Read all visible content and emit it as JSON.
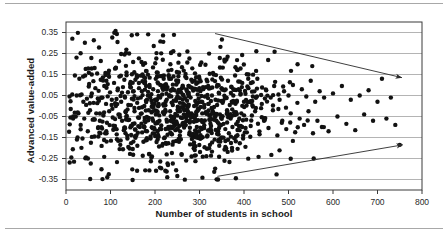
{
  "figure": {
    "kind": "scatter-plot",
    "width": 448,
    "height": 240,
    "background": "#ffffff",
    "frame_color": "#3a3a3a",
    "grid_color": "#b4b4b4",
    "point_color": "#111111",
    "arrow_color": "#2a2a2a",
    "rule_color": "#a8a8a8"
  },
  "chart_data": {
    "type": "scatter",
    "title": "",
    "subtitle": "",
    "xlabel": "Number of students in school",
    "ylabel": "Advanced value-added",
    "xlim": [
      0,
      800
    ],
    "ylim": [
      -0.4,
      0.4
    ],
    "xticks": [
      0,
      100,
      200,
      300,
      400,
      500,
      600,
      700,
      800
    ],
    "xtick_labels": [
      "0",
      "100",
      "200",
      "300",
      "400",
      "500",
      "600",
      "700",
      "800"
    ],
    "yticks": [
      0.35,
      0.25,
      0.15,
      0.05,
      -0.05,
      -0.15,
      -0.25,
      -0.35
    ],
    "ytick_labels": [
      "0.35",
      "0.25",
      "0.15",
      "0.05",
      "-0.05",
      "-0.15",
      "-0.25",
      "-0.35"
    ],
    "grid": "horizontal",
    "legend": "none",
    "marker": {
      "shape": "circle",
      "size_px": 4.4,
      "color": "#111111"
    },
    "n_points": 1000,
    "annotations": [
      {
        "name": "upper-trend-arrow",
        "kind": "arrow",
        "description": "descending arrow over upper scatter envelope",
        "x_start": 335,
        "y_start": 0.345,
        "x_end": 755,
        "y_end": 0.135
      },
      {
        "name": "lower-trend-arrow",
        "kind": "arrow",
        "description": "ascending arrow under lower scatter envelope",
        "x_start": 340,
        "y_start": -0.335,
        "x_end": 757,
        "y_end": -0.185
      }
    ],
    "series": [
      {
        "name": "schools",
        "points": [
          [
            8,
            0.045
          ],
          [
            10,
            -0.055
          ],
          [
            12,
            -0.245
          ],
          [
            14,
            0.055
          ],
          [
            16,
            -0.06
          ],
          [
            18,
            -0.265
          ],
          [
            20,
            0.145
          ],
          [
            22,
            -0.05
          ],
          [
            24,
            0.05
          ],
          [
            26,
            -0.15
          ],
          [
            28,
            -0.035
          ],
          [
            30,
            0.13
          ],
          [
            33,
            -0.09
          ],
          [
            35,
            0.055
          ],
          [
            37,
            -0.155
          ],
          [
            39,
            0.02
          ],
          [
            41,
            -0.06
          ],
          [
            43,
            0.145
          ],
          [
            45,
            -0.245
          ],
          [
            47,
            0.035
          ],
          [
            49,
            -0.12
          ],
          [
            52,
            0.105
          ],
          [
            54,
            -0.02
          ],
          [
            56,
            -0.175
          ],
          [
            58,
            0.06
          ],
          [
            60,
            -0.065
          ],
          [
            62,
            0.015
          ],
          [
            64,
            -0.145
          ],
          [
            66,
            0.085
          ],
          [
            68,
            -0.035
          ],
          [
            70,
            0.155
          ],
          [
            72,
            -0.105
          ],
          [
            74,
            0.025
          ],
          [
            76,
            -0.07
          ],
          [
            78,
            0.125
          ],
          [
            80,
            -0.19
          ],
          [
            82,
            0.04
          ],
          [
            84,
            -0.045
          ],
          [
            86,
            0.095
          ],
          [
            88,
            -0.13
          ],
          [
            90,
            0.01
          ],
          [
            92,
            -0.08
          ],
          [
            95,
            0.155
          ],
          [
            97,
            -0.025
          ],
          [
            99,
            0.065
          ],
          [
            101,
            -0.165
          ],
          [
            103,
            0.03
          ],
          [
            105,
            -0.055
          ],
          [
            108,
            0.11
          ],
          [
            110,
            -0.095
          ],
          [
            112,
            0.0
          ],
          [
            114,
            -0.135
          ],
          [
            116,
            0.075
          ],
          [
            118,
            -0.04
          ],
          [
            120,
            0.14
          ],
          [
            122,
            -0.185
          ],
          [
            124,
            0.02
          ],
          [
            126,
            -0.07
          ],
          [
            128,
            0.09
          ],
          [
            130,
            -0.115
          ],
          [
            132,
            0.045
          ],
          [
            134,
            -0.03
          ],
          [
            136,
            0.16
          ],
          [
            138,
            -0.155
          ],
          [
            140,
            0.005
          ],
          [
            142,
            -0.065
          ],
          [
            144,
            0.105
          ],
          [
            146,
            -0.095
          ],
          [
            148,
            0.035
          ],
          [
            150,
            -0.205
          ],
          [
            152,
            0.07
          ],
          [
            154,
            -0.025
          ],
          [
            156,
            0.125
          ],
          [
            158,
            -0.14
          ],
          [
            160,
            0.015
          ],
          [
            162,
            -0.055
          ],
          [
            164,
            0.085
          ],
          [
            166,
            -0.1
          ],
          [
            168,
            0.04
          ],
          [
            170,
            -0.035
          ],
          [
            172,
            0.15
          ],
          [
            174,
            -0.17
          ],
          [
            176,
            0.0
          ],
          [
            178,
            -0.075
          ],
          [
            180,
            0.095
          ],
          [
            182,
            -0.12
          ],
          [
            184,
            0.05
          ],
          [
            186,
            -0.02
          ],
          [
            188,
            0.135
          ],
          [
            190,
            -0.145
          ],
          [
            192,
            0.025
          ],
          [
            194,
            -0.06
          ],
          [
            196,
            0.08
          ],
          [
            198,
            -0.105
          ],
          [
            200,
            0.03
          ],
          [
            202,
            -0.04
          ],
          [
            204,
            0.16
          ],
          [
            206,
            -0.16
          ],
          [
            208,
            0.01
          ],
          [
            210,
            -0.07
          ],
          [
            212,
            0.1
          ],
          [
            214,
            -0.11
          ],
          [
            216,
            0.055
          ],
          [
            218,
            -0.03
          ],
          [
            220,
            0.145
          ],
          [
            222,
            -0.15
          ],
          [
            224,
            0.02
          ],
          [
            226,
            -0.065
          ],
          [
            228,
            0.09
          ],
          [
            230,
            -0.1
          ],
          [
            232,
            0.045
          ],
          [
            234,
            -0.025
          ],
          [
            236,
            0.13
          ],
          [
            238,
            -0.135
          ],
          [
            240,
            0.005
          ],
          [
            242,
            -0.08
          ],
          [
            244,
            0.075
          ],
          [
            246,
            -0.115
          ],
          [
            248,
            0.035
          ],
          [
            250,
            -0.045
          ],
          [
            252,
            0.12
          ],
          [
            254,
            -0.17
          ],
          [
            256,
            0.015
          ],
          [
            258,
            -0.055
          ],
          [
            260,
            0.085
          ],
          [
            262,
            -0.09
          ],
          [
            264,
            0.05
          ],
          [
            266,
            -0.02
          ],
          [
            268,
            0.14
          ],
          [
            270,
            -0.26
          ],
          [
            272,
            0.025
          ],
          [
            274,
            -0.07
          ],
          [
            276,
            0.095
          ],
          [
            278,
            -0.125
          ],
          [
            280,
            0.04
          ],
          [
            282,
            -0.035
          ],
          [
            284,
            0.115
          ],
          [
            286,
            -0.145
          ],
          [
            288,
            0.0
          ],
          [
            290,
            -0.06
          ],
          [
            292,
            0.08
          ],
          [
            294,
            -0.1
          ],
          [
            296,
            0.055
          ],
          [
            298,
            -0.015
          ],
          [
            300,
            0.13
          ],
          [
            302,
            -0.155
          ],
          [
            304,
            0.02
          ],
          [
            306,
            -0.075
          ],
          [
            308,
            0.09
          ],
          [
            310,
            -0.105
          ],
          [
            312,
            0.045
          ],
          [
            314,
            -0.03
          ],
          [
            316,
            0.125
          ],
          [
            318,
            -0.14
          ],
          [
            320,
            0.01
          ],
          [
            322,
            -0.065
          ],
          [
            324,
            0.085
          ],
          [
            326,
            -0.095
          ],
          [
            328,
            0.05
          ],
          [
            330,
            -0.025
          ],
          [
            332,
            0.15
          ],
          [
            334,
            -0.16
          ],
          [
            336,
            0.03
          ],
          [
            338,
            -0.07
          ],
          [
            340,
            0.1
          ],
          [
            342,
            -0.12
          ],
          [
            344,
            0.06
          ],
          [
            346,
            -0.04
          ],
          [
            348,
            0.135
          ],
          [
            350,
            -0.15
          ],
          [
            352,
            0.015
          ],
          [
            354,
            -0.085
          ],
          [
            356,
            0.075
          ],
          [
            358,
            -0.11
          ],
          [
            360,
            0.04
          ],
          [
            362,
            -0.02
          ],
          [
            364,
            0.12
          ],
          [
            366,
            -0.13
          ],
          [
            368,
            0.005
          ],
          [
            370,
            -0.06
          ],
          [
            372,
            0.09
          ],
          [
            374,
            -0.1
          ],
          [
            376,
            0.05
          ],
          [
            378,
            -0.03
          ],
          [
            380,
            0.145
          ],
          [
            382,
            -0.145
          ],
          [
            384,
            0.025
          ],
          [
            386,
            -0.075
          ],
          [
            388,
            0.08
          ],
          [
            390,
            -0.115
          ],
          [
            392,
            0.055
          ],
          [
            394,
            -0.035
          ],
          [
            396,
            0.11
          ],
          [
            398,
            -0.155
          ],
          [
            400,
            0.02
          ],
          [
            405,
            -0.065
          ],
          [
            410,
            0.085
          ],
          [
            415,
            -0.095
          ],
          [
            420,
            0.045
          ],
          [
            425,
            -0.025
          ],
          [
            430,
            0.13
          ],
          [
            435,
            -0.135
          ],
          [
            440,
            0.01
          ],
          [
            445,
            -0.07
          ],
          [
            450,
            0.075
          ],
          [
            455,
            -0.105
          ],
          [
            460,
            0.04
          ],
          [
            465,
            -0.02
          ],
          [
            470,
            0.115
          ],
          [
            475,
            -0.14
          ],
          [
            480,
            0.03
          ],
          [
            485,
            -0.08
          ],
          [
            490,
            0.07
          ],
          [
            495,
            -0.11
          ],
          [
            500,
            0.05
          ],
          [
            505,
            -0.035
          ],
          [
            510,
            0.1
          ],
          [
            515,
            -0.125
          ],
          [
            520,
            0.015
          ],
          [
            525,
            -0.06
          ],
          [
            530,
            0.08
          ],
          [
            535,
            -0.09
          ],
          [
            540,
            0.045
          ],
          [
            545,
            -0.025
          ],
          [
            550,
            0.12
          ],
          [
            555,
            -0.13
          ],
          [
            560,
            0.02
          ],
          [
            565,
            -0.07
          ],
          [
            570,
            0.07
          ],
          [
            575,
            -0.1
          ],
          [
            580,
            0.04
          ],
          [
            590,
            -0.12
          ],
          [
            600,
            0.06
          ],
          [
            610,
            -0.05
          ],
          [
            620,
            0.095
          ],
          [
            630,
            -0.085
          ],
          [
            640,
            0.03
          ],
          [
            650,
            -0.115
          ],
          [
            660,
            0.05
          ],
          [
            670,
            -0.04
          ],
          [
            680,
            0.075
          ],
          [
            690,
            -0.07
          ],
          [
            700,
            0.02
          ],
          [
            710,
            0.13
          ],
          [
            720,
            -0.06
          ],
          [
            730,
            0.04
          ],
          [
            740,
            -0.09
          ],
          [
            750,
            -0.185
          ]
        ]
      }
    ]
  }
}
